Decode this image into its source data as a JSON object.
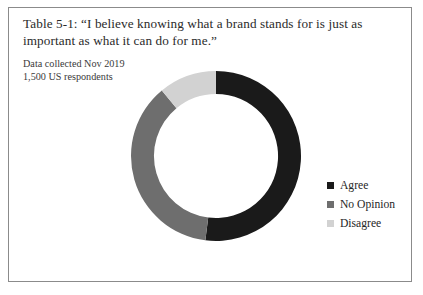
{
  "figure": {
    "title": "Table 5-1: “I believe knowing what a brand stands for is just as important as what it can do for me.”",
    "subtitle_line1": "Data collected Nov 2019",
    "subtitle_line2": "1,500 US respondents",
    "border_color": "#8b8b8b",
    "background": "#ffffff"
  },
  "chart_data": {
    "type": "pie",
    "variant": "donut",
    "title": "Table 5-1: “I believe knowing what a brand stands for is just as important as what it can do for me.”",
    "subtitle": "Data collected Nov 2019 — 1,500 US respondents",
    "xlabel": "",
    "ylabel": "",
    "legend_position": "right",
    "grid": false,
    "start_angle_deg": 0,
    "direction": "clockwise",
    "inner_radius_ratio": 0.73,
    "categories": [
      "Agree",
      "No Opinion",
      "Disagree"
    ],
    "values": [
      52,
      37,
      11
    ],
    "units": "percent",
    "colors": [
      "#1a1a1a",
      "#6e6e6e",
      "#d2d2d2"
    ],
    "slices": [
      {
        "label": "Agree",
        "value": 52,
        "color": "#1a1a1a",
        "start_deg": 0,
        "end_deg": 187.2
      },
      {
        "label": "No Opinion",
        "value": 37,
        "color": "#6e6e6e",
        "start_deg": 187.2,
        "end_deg": 320.4
      },
      {
        "label": "Disagree",
        "value": 11,
        "color": "#d2d2d2",
        "start_deg": 320.4,
        "end_deg": 360
      }
    ]
  },
  "legend": {
    "items": [
      {
        "label": "Agree",
        "color": "#1a1a1a"
      },
      {
        "label": "No Opinion",
        "color": "#6e6e6e"
      },
      {
        "label": "Disagree",
        "color": "#d2d2d2"
      }
    ]
  }
}
